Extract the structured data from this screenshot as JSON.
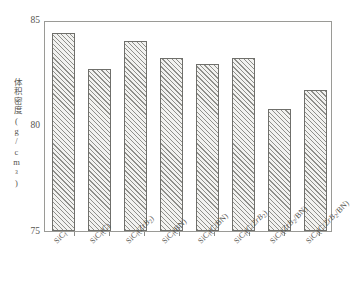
{
  "chart_data": {
    "type": "bar",
    "title": "",
    "xlabel": "",
    "ylabel": "体积密度(g/cm³)",
    "ylim": [
      75,
      85
    ],
    "yticks": [
      75,
      80,
      85
    ],
    "ytick_labels": [
      "75",
      "80",
      "85"
    ],
    "yminor_ticks": [
      77.5,
      82.5
    ],
    "grid": false,
    "legend": null,
    "categories": [
      "SiCf",
      "SiCf(C)",
      "SiCf(ZrB2)",
      "SiCf(BN)",
      "SiCf(C/BN)",
      "SiCf(C/ZrB2)",
      "SiCf(ZrB2/BN)",
      "SiCf(C/ZrB2/BN)"
    ],
    "category_labels_html": [
      "SiC<sub>f</sub>",
      "SiC<sub>f</sub>(C)",
      "SiC<sub>f</sub>(<i>Zr</i><i>B</i><sub>2</sub>)",
      "SiC<sub>f</sub>(BN)",
      "SiC<sub>f</sub>(C/BN)",
      "SiC<sub>f</sub>(C/<i>Zr</i><i>B</i><sub>2</sub>)",
      "SiC<sub>f</sub>(<i>Zr</i><i>B</i><sub>2</sub>/BN)",
      "SiC<sub>f</sub>(C/<i>Zr</i><i>B</i><sub>2</sub>/BN)"
    ],
    "values": [
      84.4,
      82.7,
      84.0,
      83.2,
      82.9,
      83.2,
      80.8,
      81.7
    ],
    "bar_fill": "#f2f2f0",
    "bar_hatch": "diagonal-45",
    "bar_edge_color": "#6f6f6b",
    "axis_color": "#9a9a96",
    "text_color": "#55544f"
  }
}
